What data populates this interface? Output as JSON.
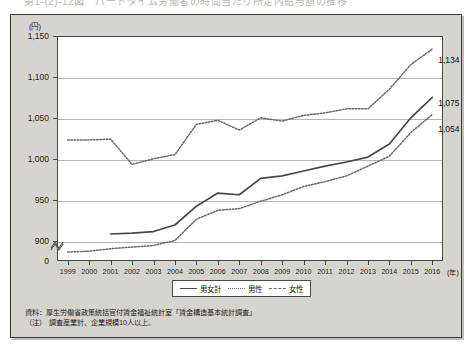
{
  "figure": {
    "cut_title": "第1-(2)-12図　パートタイム労働者の時間当たり所定内給与額の推移",
    "y_axis_unit": "(円)",
    "x_axis_unit": "(年)"
  },
  "legend": {
    "position": "bottom-center",
    "items": [
      {
        "label": "男女計",
        "style": "solid"
      },
      {
        "label": "男性",
        "style": "dotted"
      },
      {
        "label": "女性",
        "style": "dashed"
      }
    ]
  },
  "notes": [
    "資料：厚生労働省政策統括官付賃金福祉統計室「賃金構造基本統計調査」",
    "（注）　調査産業計、企業規模10人以上。"
  ],
  "colors": {
    "panel_background": "#d6d4cf",
    "plot_background": "#ffffff",
    "frame": "#3c3a37",
    "gridline": "#b6b4b0",
    "line_total": "#4a4845",
    "line_male": "#6a6764",
    "line_female": "#6a6764"
  },
  "end_labels": [
    {
      "name": "male-end-label",
      "value": "1,134"
    },
    {
      "name": "total-end-label",
      "value": "1,075"
    },
    {
      "name": "female-end-label",
      "value": "1,054"
    }
  ],
  "chart_data": {
    "type": "line",
    "xlabel": "(年)",
    "ylabel": "(円)",
    "ylim": [
      875,
      1150
    ],
    "y_ticks": [
      "1,150",
      "1,100",
      "1,050",
      "1,000",
      "950",
      "900",
      "0"
    ],
    "y_tick_values": [
      1150,
      1100,
      1050,
      1000,
      950,
      900,
      875
    ],
    "axis_break": true,
    "grid": true,
    "categories": [
      "1999",
      "2000",
      "2001",
      "2002",
      "2003",
      "2004",
      "2005",
      "2006",
      "2007",
      "2008",
      "2009",
      "2010",
      "2011",
      "2012",
      "2013",
      "2014",
      "2015",
      "2016"
    ],
    "series": [
      {
        "name": "男女計",
        "style": "solid",
        "values": [
          null,
          null,
          908,
          909,
          911,
          919,
          942,
          958,
          956,
          976,
          979,
          985,
          991,
          996,
          1002,
          1018,
          1050,
          1075
        ]
      },
      {
        "name": "男性",
        "style": "dotted",
        "values": [
          1023,
          1023,
          1024,
          993,
          1000,
          1005,
          1042,
          1047,
          1035,
          1050,
          1046,
          1053,
          1056,
          1061,
          1061,
          1085,
          1115,
          1134
        ]
      },
      {
        "name": "女性",
        "style": "dashed",
        "values": [
          886,
          887,
          890,
          892,
          894,
          900,
          926,
          937,
          939,
          948,
          956,
          966,
          972,
          979,
          991,
          1003,
          1032,
          1054
        ]
      }
    ]
  }
}
